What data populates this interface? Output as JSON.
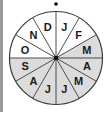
{
  "diagram": {
    "type": "month-wheel",
    "center": [
      56,
      58
    ],
    "radius": 46.5,
    "label_radius": 32,
    "top_marker": [
      56,
      4
    ],
    "colors": {
      "shaded": "#dcdcdc",
      "unshaded": "#ffffff",
      "line": "#3a3a3a",
      "text": "#1a1a1a",
      "left_bar": "#9a9a9a"
    },
    "sectors": [
      {
        "label": "J",
        "start_deg": 0,
        "shaded": false
      },
      {
        "label": "F",
        "start_deg": 30,
        "shaded": false
      },
      {
        "label": "M",
        "start_deg": 60,
        "shaded": true
      },
      {
        "label": "A",
        "start_deg": 90,
        "shaded": true
      },
      {
        "label": "M",
        "start_deg": 120,
        "shaded": true
      },
      {
        "label": "J",
        "start_deg": 150,
        "shaded": true
      },
      {
        "label": "J",
        "start_deg": 180,
        "shaded": true
      },
      {
        "label": "A",
        "start_deg": 210,
        "shaded": true
      },
      {
        "label": "S",
        "start_deg": 240,
        "shaded": true
      },
      {
        "label": "O",
        "start_deg": 270,
        "shaded": false
      },
      {
        "label": "N",
        "start_deg": 300,
        "shaded": false
      },
      {
        "label": "D",
        "start_deg": 330,
        "shaded": false
      }
    ]
  }
}
